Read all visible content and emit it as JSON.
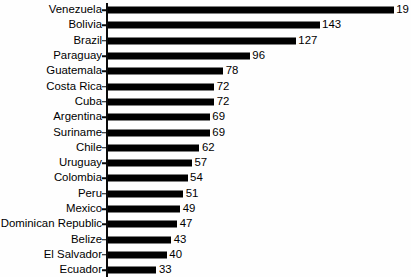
{
  "chart_data": {
    "type": "bar",
    "orientation": "horizontal",
    "title": "",
    "subtitle": "",
    "xlabel": "",
    "ylabel": "",
    "grid": false,
    "legend": null,
    "axis": {
      "value_axis_min": 0,
      "value_axis_max": 193,
      "ticks_shown": false,
      "category_tick_marks": true,
      "baseline_visible": true
    },
    "note": "Top bar value label is clipped by the right image edge; only the first two digits render.",
    "categories": [
      "Venezuela",
      "Bolivia",
      "Brazil",
      "Paraguay",
      "Guatemala",
      "Costa Rica",
      "Cuba",
      "Argentina",
      "Suriname",
      "Chile",
      "Uruguay",
      "Colombia",
      "Peru",
      "Mexico",
      "Dominican Republic",
      "Belize",
      "El Salvador",
      "Ecuador"
    ],
    "values": [
      193,
      143,
      127,
      96,
      78,
      72,
      72,
      69,
      69,
      62,
      57,
      54,
      51,
      49,
      47,
      43,
      40,
      33
    ],
    "value_labels": [
      "19",
      "143",
      "127",
      "96",
      "78",
      "72",
      "72",
      "69",
      "69",
      "62",
      "57",
      "54",
      "51",
      "49",
      "47",
      "43",
      "40",
      "33"
    ],
    "colors": {
      "bar": "#000000",
      "axis": "#0a0a0a",
      "text": "#000000",
      "background": "#fefefe"
    }
  },
  "background_ghost_text": [
    "",
    "",
    "",
    "",
    "",
    "",
    "",
    "",
    "",
    "",
    "",
    "",
    "",
    "",
    "",
    "",
    "",
    ""
  ]
}
